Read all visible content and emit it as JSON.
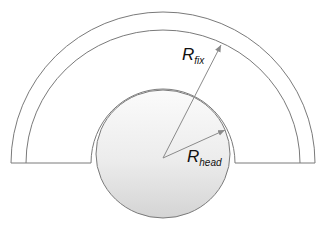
{
  "diagram": {
    "labels": {
      "r_fix": {
        "main": "R",
        "sub": "fix"
      },
      "r_head": {
        "main": "R",
        "sub": "head"
      }
    },
    "colors": {
      "stroke": "#7a7a7a",
      "arrow": "#8a8a8a",
      "head_fill_light": "#fbfbfb",
      "head_fill_dark": "#d6d6d6"
    }
  }
}
